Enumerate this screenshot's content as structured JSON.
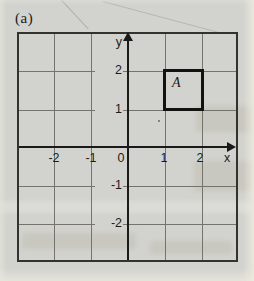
{
  "figure": {
    "caption_label": "(a)",
    "plot": {
      "x_axis_label": "x",
      "y_axis_label": "y",
      "origin_label": "0",
      "x_tick_labels": [
        "-2",
        "-1",
        "1",
        "2"
      ],
      "y_tick_labels": [
        "2",
        "1",
        "-1",
        "-2"
      ],
      "x_range": [
        -3,
        3
      ],
      "y_range": [
        -3,
        3
      ],
      "grid": true,
      "shape": {
        "label": "A",
        "type": "square",
        "vertices": [
          [
            1,
            1
          ],
          [
            2,
            1
          ],
          [
            2,
            2
          ],
          [
            1,
            2
          ]
        ]
      }
    },
    "colors": {
      "paper": "#d2d3ce",
      "gridline": "#74746c",
      "axis": "#1a1a18",
      "outer_border": "#32322e",
      "shape_border": "#121210",
      "text": "#1b1b1a"
    }
  }
}
